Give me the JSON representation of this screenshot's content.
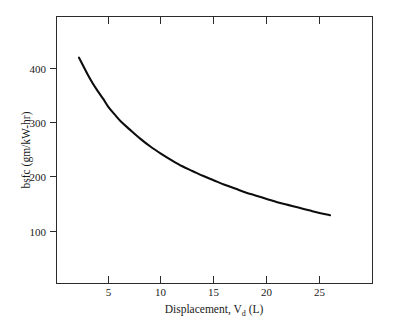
{
  "chart_data": {
    "type": "line",
    "title": "",
    "xlabel": "Displacement, V_d (L)",
    "xlabel_main": "Displacement, V",
    "xlabel_sub": "d",
    "xlabel_tail": " (L)",
    "ylabel": "bsfc (gm/kW-hr)",
    "xlim": [
      1,
      30
    ],
    "ylim": [
      30,
      460
    ],
    "xticks": [
      5,
      10,
      15,
      20,
      25
    ],
    "yticks": [
      100,
      200,
      300,
      400
    ],
    "xtick_labels": [
      "5",
      "10",
      "15",
      "20",
      "25"
    ],
    "ytick_labels": [
      "100",
      "200",
      "300",
      "400"
    ],
    "grid": false,
    "legend": false,
    "legend_position": "none",
    "series": [
      {
        "name": "bsfc",
        "color": "#0d0d0d",
        "x": [
          2.2,
          2.6,
          3.0,
          3.5,
          4.0,
          4.5,
          5.0,
          5.6,
          6.2,
          7.0,
          8.0,
          9.0,
          10.0,
          11.0,
          12.0,
          13.0,
          14.0,
          15.0,
          16.0,
          17.0,
          18.0,
          19.0,
          20.0,
          21.0,
          22.0,
          23.0,
          24.0,
          25.0,
          26.0
        ],
        "y": [
          420,
          405,
          390,
          373,
          358,
          344,
          329,
          315,
          302,
          288,
          271,
          256,
          243,
          231,
          220,
          211,
          202,
          194,
          186,
          179,
          172,
          166,
          160,
          154,
          149,
          144,
          139,
          134,
          130
        ]
      }
    ]
  },
  "figure": {
    "background_color": "#ffffff",
    "axis_color": "#2b2b2b",
    "curve_color": "#0d0d0d"
  }
}
